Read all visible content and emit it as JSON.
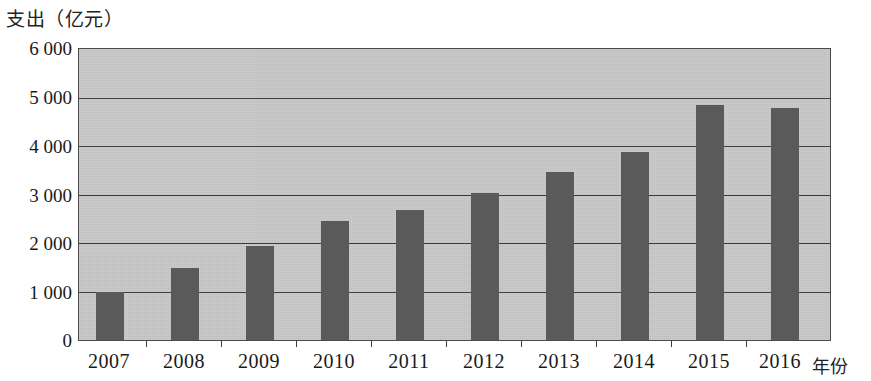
{
  "chart_data": {
    "type": "bar",
    "title": "",
    "ylabel": "支出（亿元）",
    "xlabel": "年份",
    "categories": [
      "2007",
      "2008",
      "2009",
      "2010",
      "2011",
      "2012",
      "2013",
      "2014",
      "2015",
      "2016"
    ],
    "values": [
      1000,
      1480,
      1930,
      2460,
      2680,
      3030,
      3470,
      3880,
      4850,
      4790
    ],
    "ylim": [
      0,
      6000
    ],
    "ytick_values": [
      0,
      1000,
      2000,
      3000,
      4000,
      5000,
      6000
    ],
    "ytick_labels": [
      "0",
      "1 000",
      "2 000",
      "3 000",
      "4 000",
      "5 000",
      "6 000"
    ],
    "grid": true,
    "legend": "none",
    "bar_color": "#5a5a5a",
    "plot_background_color": "#c9c9c9",
    "axis_color": "#3d3d3d"
  }
}
